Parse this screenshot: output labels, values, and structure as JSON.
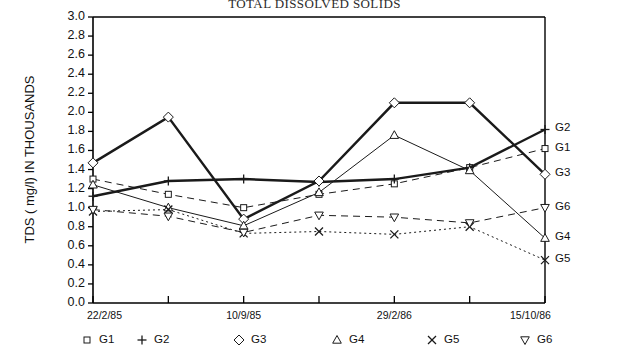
{
  "chart_data": {
    "type": "line",
    "title": "TOTAL DISSOLVED SOLIDS",
    "xlabel": "",
    "ylabel": "TDS ( mg/l) IN THOUSANDS",
    "ylim": [
      0.0,
      3.0
    ],
    "ytick_step": 0.2,
    "ytick_labels": [
      "3.0",
      "2.8",
      "2.6",
      "2.4",
      "2.2",
      "2.0",
      "1.8",
      "1.6",
      "1.4",
      "1.2",
      "1.0",
      "0.8",
      "0.6",
      "0.4",
      "0.2",
      "0.0"
    ],
    "grid": false,
    "legend_position": "below-axes",
    "x_tick_count": 7,
    "x_tick_labels": [
      {
        "index": 0,
        "label": "22/2/85"
      },
      {
        "index": 2,
        "label": "10/9/85"
      },
      {
        "index": 4,
        "label": "29/2/86"
      },
      {
        "index": 6,
        "label": "15/10/86"
      }
    ],
    "x_indices": [
      0,
      1,
      2,
      3,
      4,
      5,
      6
    ],
    "series": [
      {
        "name": "G1",
        "marker": "square",
        "line_style": "dashed",
        "line_width": "thin",
        "end_label": "G1",
        "values": [
          1.3,
          1.14,
          1.0,
          1.14,
          1.25,
          1.42,
          1.62
        ]
      },
      {
        "name": "G2",
        "marker": "plus",
        "line_style": "solid",
        "line_width": "thick",
        "end_label": "G2",
        "values": [
          1.12,
          1.28,
          1.3,
          1.27,
          1.3,
          1.42,
          1.82
        ]
      },
      {
        "name": "G3",
        "marker": "diamond",
        "line_style": "solid",
        "line_width": "thick",
        "end_label": "G3",
        "values": [
          1.47,
          1.95,
          0.88,
          1.28,
          2.1,
          2.1,
          1.35
        ]
      },
      {
        "name": "G4",
        "marker": "triangle-up",
        "line_style": "solid",
        "line_width": "thin",
        "end_label": "G4",
        "values": [
          1.24,
          1.0,
          0.81,
          1.16,
          1.76,
          1.39,
          0.68
        ]
      },
      {
        "name": "G5",
        "marker": "cross",
        "line_style": "dotted",
        "line_width": "thin",
        "end_label": "G5",
        "values": [
          0.96,
          0.98,
          0.73,
          0.75,
          0.72,
          0.8,
          0.45
        ]
      },
      {
        "name": "G6",
        "marker": "triangle-down",
        "line_style": "dashed",
        "line_width": "thin",
        "end_label": "G6",
        "values": [
          0.98,
          0.91,
          0.74,
          0.92,
          0.9,
          0.84,
          1.0
        ]
      }
    ]
  },
  "legend": {
    "items": [
      {
        "marker": "square",
        "label": "G1"
      },
      {
        "marker": "plus",
        "label": "G2"
      },
      {
        "marker": "diamond",
        "label": "G3"
      },
      {
        "marker": "triangle-up",
        "label": "G4"
      },
      {
        "marker": "cross",
        "label": "G5"
      },
      {
        "marker": "triangle-down",
        "label": "G6"
      }
    ]
  },
  "colors": {
    "axis": "#000000",
    "series_line": "#1a1a1a",
    "background": "#ffffff",
    "text": "#111111"
  }
}
